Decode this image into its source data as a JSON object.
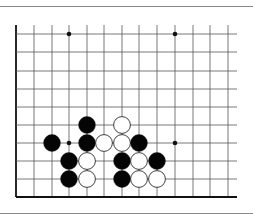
{
  "diagram": {
    "type": "go-board-corner",
    "title": "",
    "board": {
      "cols": 13,
      "rows": 10,
      "col_x": [
        16,
        34,
        52,
        69,
        87,
        104,
        122,
        139,
        157,
        175,
        193,
        210,
        228
      ],
      "row_y": [
        34,
        52,
        71,
        89,
        107,
        125,
        143,
        161,
        179,
        197
      ],
      "top_y": 25,
      "right_x": 237,
      "edges": [
        "left",
        "bottom"
      ]
    },
    "star_points": [
      {
        "col": 3,
        "row": 0
      },
      {
        "col": 9,
        "row": 0
      },
      {
        "col": 3,
        "row": 6
      },
      {
        "col": 9,
        "row": 6
      }
    ],
    "stones": [
      {
        "color": "black",
        "col": 4,
        "row": 5
      },
      {
        "color": "white",
        "col": 6,
        "row": 5
      },
      {
        "color": "black",
        "col": 2,
        "row": 6
      },
      {
        "color": "black",
        "col": 4,
        "row": 6
      },
      {
        "color": "white",
        "col": 5,
        "row": 6
      },
      {
        "color": "white",
        "col": 6,
        "row": 6
      },
      {
        "color": "black",
        "col": 7,
        "row": 6
      },
      {
        "color": "black",
        "col": 3,
        "row": 7
      },
      {
        "color": "white",
        "col": 4,
        "row": 7
      },
      {
        "color": "black",
        "col": 6,
        "row": 7
      },
      {
        "color": "white",
        "col": 7,
        "row": 7
      },
      {
        "color": "black",
        "col": 8,
        "row": 7
      },
      {
        "color": "black",
        "col": 3,
        "row": 8
      },
      {
        "color": "white",
        "col": 4,
        "row": 8
      },
      {
        "color": "black",
        "col": 6,
        "row": 8
      },
      {
        "color": "white",
        "col": 7,
        "row": 8
      },
      {
        "color": "white",
        "col": 8,
        "row": 8
      }
    ],
    "colors": {
      "grid": "#555555",
      "edge": "#111111",
      "black_stone": "#050505",
      "white_stone": "#ffffff",
      "separator": "#8a8a8a"
    }
  }
}
